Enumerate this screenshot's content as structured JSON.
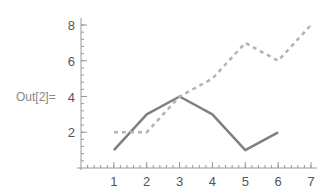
{
  "cell": {
    "out_label": "Out[2]="
  },
  "chart_data": {
    "type": "line",
    "title": "",
    "xlabel": "",
    "ylabel": "",
    "xlim": [
      0,
      7
    ],
    "ylim": [
      0,
      8
    ],
    "grid": false,
    "legend": null,
    "x_ticks": [
      1,
      2,
      3,
      4,
      5,
      6,
      7
    ],
    "y_ticks": [
      2,
      4,
      6,
      8
    ],
    "series": [
      {
        "name": "solid",
        "style": "solid",
        "color": "#808080",
        "x": [
          1,
          2,
          3,
          4,
          5,
          6
        ],
        "values": [
          1,
          3,
          4,
          3,
          1,
          2
        ]
      },
      {
        "name": "dashed",
        "style": "dashed",
        "color": "#b3b3b3",
        "x": [
          1,
          2,
          3,
          4,
          5,
          6,
          7
        ],
        "values": [
          2,
          2,
          4,
          5,
          7,
          6,
          8
        ]
      }
    ]
  }
}
